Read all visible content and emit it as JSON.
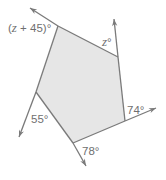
{
  "figure": {
    "type": "pentagon-exterior-angles",
    "fill_color": "#e6e6e6",
    "line_color": "#7a7a7a",
    "label_color": "#6f6f6f",
    "vertices": [
      {
        "name": "top-left",
        "x": 58,
        "y": 26
      },
      {
        "name": "top-right",
        "x": 118,
        "y": 57
      },
      {
        "name": "right",
        "x": 125,
        "y": 121
      },
      {
        "name": "bottom",
        "x": 73,
        "y": 143
      },
      {
        "name": "left",
        "x": 36,
        "y": 92
      }
    ],
    "rays": [
      {
        "from": "top-left",
        "to_x": 30,
        "to_y": 8
      },
      {
        "from": "top-right",
        "to_x": 114,
        "to_y": 19
      },
      {
        "from": "right",
        "to_x": 156,
        "to_y": 108
      },
      {
        "from": "bottom",
        "to_x": 86,
        "to_y": 166
      },
      {
        "from": "left",
        "to_x": 19,
        "to_y": 137
      }
    ],
    "angle_labels": [
      {
        "id": "angle-top-left",
        "var": "z",
        "text_before": "(",
        "text_after": " + 45)°",
        "x": 8,
        "y": 32
      },
      {
        "id": "angle-top-right",
        "var": "z",
        "text_before": "",
        "text_after": "°",
        "x": 102,
        "y": 46
      },
      {
        "id": "angle-right",
        "var": "",
        "text_before": "74°",
        "text_after": "",
        "x": 127,
        "y": 114
      },
      {
        "id": "angle-bottom",
        "var": "",
        "text_before": "78°",
        "text_after": "",
        "x": 82,
        "y": 155
      },
      {
        "id": "angle-left",
        "var": "",
        "text_before": "55°",
        "text_after": "",
        "x": 31,
        "y": 123
      }
    ]
  }
}
